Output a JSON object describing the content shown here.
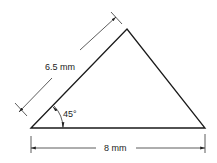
{
  "diagram": {
    "type": "triangle-dimension-drawing",
    "shape": "triangle",
    "vertices": {
      "left": [
        31,
        128
      ],
      "top": [
        127,
        29
      ],
      "right": [
        205,
        128
      ]
    },
    "labels": {
      "slant_side": "6.5 mm",
      "base": "8 mm",
      "angle": "45°"
    },
    "colors": {
      "stroke": "#1a1a1a",
      "dimension": "#333333",
      "background": "#ffffff"
    }
  }
}
